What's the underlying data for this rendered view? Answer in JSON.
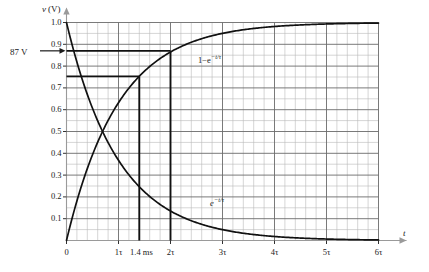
{
  "chart_data": {
    "type": "line",
    "title": "",
    "xlabel": "t",
    "ylabel": "v (V)",
    "xlim": [
      0,
      6
    ],
    "ylim": [
      0,
      1.05
    ],
    "grid": true,
    "grid_major_x_step": 1,
    "grid_minor_x_step": 0.2,
    "grid_major_y_step": 0.1,
    "grid_minor_y_step": 0.05,
    "x_unit": "tau",
    "xticks": [
      0,
      1,
      2,
      3,
      4,
      5,
      6
    ],
    "xticklabels": [
      "0",
      "1τ",
      "2τ",
      "3τ",
      "4τ",
      "5τ",
      "6τ"
    ],
    "yticks": [
      0.1,
      0.2,
      0.3,
      0.4,
      0.5,
      0.6,
      0.7,
      0.8,
      0.9,
      1.0
    ],
    "yticklabels": [
      "0.1",
      "0.2",
      "0.3",
      "0.4",
      "0.5",
      "0.6",
      "0.7",
      "0.8",
      "0.9",
      "1.0"
    ],
    "legend_position": "inline-annotation",
    "series": [
      {
        "name": "1-e^{-t/τ}",
        "label": "1−e",
        "label_exponent": "−t/τ",
        "formula": "1-exp(-t/tau)",
        "x": [
          0,
          0.2,
          0.4,
          0.6,
          0.8,
          1.0,
          1.2,
          1.4,
          1.6,
          1.8,
          2.0,
          2.5,
          3.0,
          3.5,
          4.0,
          4.5,
          5.0,
          5.5,
          6.0
        ],
        "y": [
          0,
          0.181,
          0.33,
          0.451,
          0.551,
          0.632,
          0.699,
          0.753,
          0.798,
          0.835,
          0.865,
          0.918,
          0.95,
          0.97,
          0.982,
          0.989,
          0.993,
          0.996,
          0.998
        ]
      },
      {
        "name": "e^{-t/τ}",
        "label": "e",
        "label_exponent": "−t/τ",
        "formula": "exp(-t/tau)",
        "x": [
          0,
          0.2,
          0.4,
          0.6,
          0.8,
          1.0,
          1.2,
          1.4,
          1.6,
          1.8,
          2.0,
          2.5,
          3.0,
          3.5,
          4.0,
          4.5,
          5.0,
          5.5,
          6.0
        ],
        "y": [
          1.0,
          0.819,
          0.67,
          0.549,
          0.449,
          0.368,
          0.301,
          0.247,
          0.202,
          0.165,
          0.135,
          0.082,
          0.05,
          0.03,
          0.018,
          0.011,
          0.007,
          0.004,
          0.002
        ]
      }
    ],
    "annotations": [
      {
        "name": "v-level-087",
        "text": "87 V",
        "value": 0.87,
        "kind": "y-marker-with-arrow"
      },
      {
        "name": "t-value-1p4ms",
        "text": "1.4 ms",
        "value": 1.4,
        "kind": "x-tick-extra"
      }
    ],
    "guide_lines": [
      {
        "name": "horizontal-087",
        "orientation": "horizontal",
        "y": 0.87,
        "x_from": 0,
        "x_to": 2.0
      },
      {
        "name": "horizontal-075",
        "orientation": "horizontal",
        "y": 0.753,
        "x_from": 0,
        "x_to": 1.4
      },
      {
        "name": "vertical-1p4ms",
        "orientation": "vertical",
        "x": 1.4,
        "y_from": 0,
        "y_to": 0.753
      },
      {
        "name": "vertical-2tau",
        "orientation": "vertical",
        "x": 2.0,
        "y_from": 0,
        "y_to": 0.865
      }
    ]
  },
  "axes": {
    "y_axis_label": "v (V)",
    "y_axis_label_unit": "(V)",
    "y_axis_label_var": "v",
    "x_axis_label": "t"
  },
  "colors": {
    "curve": "#111111",
    "guide": "#111111",
    "grid_major": "#6b6b6b",
    "grid_minor": "#b9b9b9",
    "axis": "#9a9a9a",
    "text": "#1a1a1a",
    "background": "#ffffff"
  }
}
